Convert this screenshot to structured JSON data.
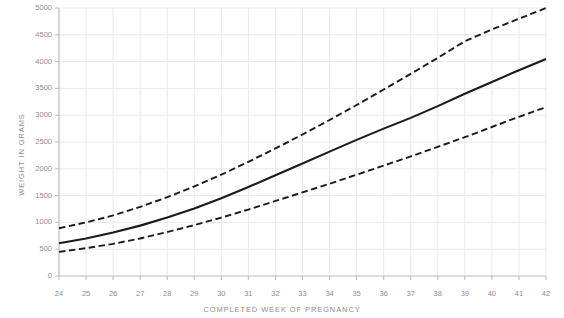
{
  "chart_data": {
    "type": "line",
    "title": "",
    "xlabel": "COMPLETED WEEK OF PREGNANCY",
    "ylabel": "WEIGHT IN GRAMS",
    "xlim": [
      24,
      42
    ],
    "ylim": [
      0,
      5000
    ],
    "grid": true,
    "legend": "none",
    "x": [
      24,
      25,
      26,
      27,
      28,
      29,
      30,
      31,
      32,
      33,
      34,
      35,
      36,
      37,
      38,
      39,
      40,
      41,
      42
    ],
    "xticks": [
      "24",
      "25",
      "26",
      "27",
      "28",
      "29",
      "30",
      "31",
      "32",
      "33",
      "34",
      "35",
      "36",
      "37",
      "38",
      "39",
      "40",
      "41",
      "42"
    ],
    "yticks": [
      "0",
      "500",
      "1000",
      "1500",
      "2000",
      "2500",
      "3000",
      "3500",
      "4000",
      "4500",
      "5000"
    ],
    "ytick_values": [
      0,
      500,
      1000,
      1500,
      2000,
      2500,
      3000,
      3500,
      4000,
      4500,
      5000
    ],
    "series": [
      {
        "name": "90th percentile",
        "style": "dashed",
        "color": "#1a1a1a",
        "values": [
          890,
          1000,
          1130,
          1290,
          1470,
          1670,
          1890,
          2130,
          2380,
          2640,
          2910,
          3190,
          3480,
          3770,
          4070,
          4380,
          4600,
          4800,
          5000
        ]
      },
      {
        "name": "50th percentile",
        "style": "solid",
        "color": "#1a1a1a",
        "values": [
          610,
          700,
          810,
          940,
          1090,
          1260,
          1450,
          1660,
          1880,
          2100,
          2320,
          2540,
          2750,
          2950,
          3170,
          3400,
          3620,
          3840,
          4050
        ]
      },
      {
        "name": "10th percentile",
        "style": "dashed",
        "color": "#1a1a1a",
        "values": [
          450,
          520,
          600,
          700,
          820,
          950,
          1090,
          1240,
          1400,
          1560,
          1720,
          1890,
          2060,
          2230,
          2410,
          2590,
          2780,
          2970,
          3150
        ]
      }
    ],
    "colors": {
      "line": "#1a1a1a",
      "grid": "#e8e8e8",
      "axis": "#b8b8b8",
      "text": "#8d8d8d",
      "background": "#ffffff"
    }
  }
}
